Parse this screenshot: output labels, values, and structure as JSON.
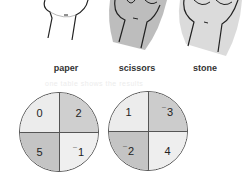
{
  "hands": [
    {
      "name": "paper",
      "label": "paper"
    },
    {
      "name": "scissors",
      "label": "scissors"
    },
    {
      "name": "stone",
      "label": "stone"
    }
  ],
  "faint_text": "one table shows the results",
  "spinners": [
    {
      "quadrants": {
        "tl": {
          "value": "0",
          "color": "#ececec"
        },
        "tr": {
          "value": "2",
          "color": "#cfcfcf"
        },
        "bl": {
          "value": "5",
          "color": "#c4c4c4"
        },
        "br": {
          "value": "1",
          "negative": true,
          "color": "#efefef"
        }
      }
    },
    {
      "quadrants": {
        "tl": {
          "value": "1",
          "color": "#ececec"
        },
        "tr": {
          "value": "3",
          "negative": true,
          "color": "#cccccc"
        },
        "bl": {
          "value": "2",
          "negative": true,
          "color": "#c4c4c4"
        },
        "br": {
          "value": "4",
          "color": "#eeeeee"
        }
      }
    }
  ],
  "negative_sign": "¯"
}
